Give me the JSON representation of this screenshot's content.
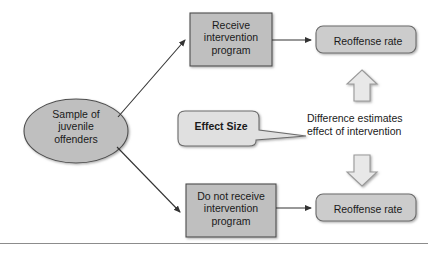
{
  "diagram": {
    "colors": {
      "node_fill": "#bfbfbf",
      "node_stroke": "#4d4d4d",
      "rounded_fill": "#cccccc",
      "callout_fill": "#e0e0e0",
      "block_arrow_fill": "#e8e8e8",
      "block_arrow_stroke": "#9a9a9a",
      "connector": "#333333",
      "text": "#1a1a1a",
      "rule": "#8c8c8c",
      "background": "#ffffff"
    },
    "nodes": [
      {
        "id": "sample",
        "shape": "ellipse",
        "label": "Sample of\njuvenile\noffenders"
      },
      {
        "id": "receive",
        "shape": "rectangle",
        "label": "Receive\nintervention\nprogram"
      },
      {
        "id": "not-receive",
        "shape": "rectangle",
        "label": "Do not receive\nintervention\nprogram"
      },
      {
        "id": "reoffense-top",
        "shape": "rounded-rectangle",
        "label": "Reoffense rate"
      },
      {
        "id": "reoffense-bottom",
        "shape": "rounded-rectangle",
        "label": "Reoffense rate"
      },
      {
        "id": "effect-size",
        "shape": "callout",
        "label": "Effect Size"
      }
    ],
    "annotation": {
      "id": "difference-note",
      "label": "Difference estimates\neffect of intervention"
    },
    "block_arrows": [
      {
        "id": "arrow-up",
        "direction": "up"
      },
      {
        "id": "arrow-down",
        "direction": "down"
      }
    ],
    "connectors": [
      {
        "id": "sample-to-receive",
        "from": "sample",
        "to": "receive",
        "style": "arrow"
      },
      {
        "id": "sample-to-not-receive",
        "from": "sample",
        "to": "not-receive",
        "style": "arrow"
      },
      {
        "id": "receive-to-reoffense-top",
        "from": "receive",
        "to": "reoffense-top",
        "style": "arrow"
      },
      {
        "id": "not-receive-to-reoffense-bottom",
        "from": "not-receive",
        "to": "reoffense-bottom",
        "style": "arrow"
      }
    ]
  }
}
